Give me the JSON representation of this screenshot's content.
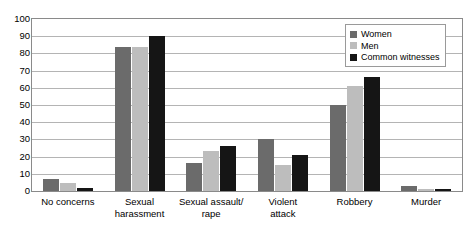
{
  "chart_data": {
    "type": "bar",
    "title": "",
    "subtitle": "",
    "xlabel": "",
    "ylabel": "",
    "ylim": [
      0,
      100
    ],
    "ytick_interval": 10,
    "yticks": [
      100,
      90,
      80,
      70,
      60,
      50,
      40,
      30,
      20,
      10,
      0
    ],
    "grid": true,
    "legend_position": "top-right",
    "categories": [
      "No concerns",
      "Sexual\nharassment",
      "Sexual assault/\nrape",
      "Violent\nattack",
      "Robbery",
      "Murder"
    ],
    "series": [
      {
        "name": "Women",
        "color": "#6b6b6b",
        "values": [
          7,
          84,
          16,
          30,
          50,
          3
        ]
      },
      {
        "name": "Men",
        "color": "#bdbdbd",
        "values": [
          4.5,
          84,
          23,
          15,
          61,
          1
        ]
      },
      {
        "name": "Common witnesses",
        "color": "#151515",
        "values": [
          1.5,
          90,
          26,
          21,
          66,
          1
        ]
      }
    ]
  },
  "legend": {
    "items": [
      {
        "label": "Women",
        "color": "#6b6b6b"
      },
      {
        "label": "Men",
        "color": "#bdbdbd"
      },
      {
        "label": "Common witnesses",
        "color": "#151515"
      }
    ]
  }
}
